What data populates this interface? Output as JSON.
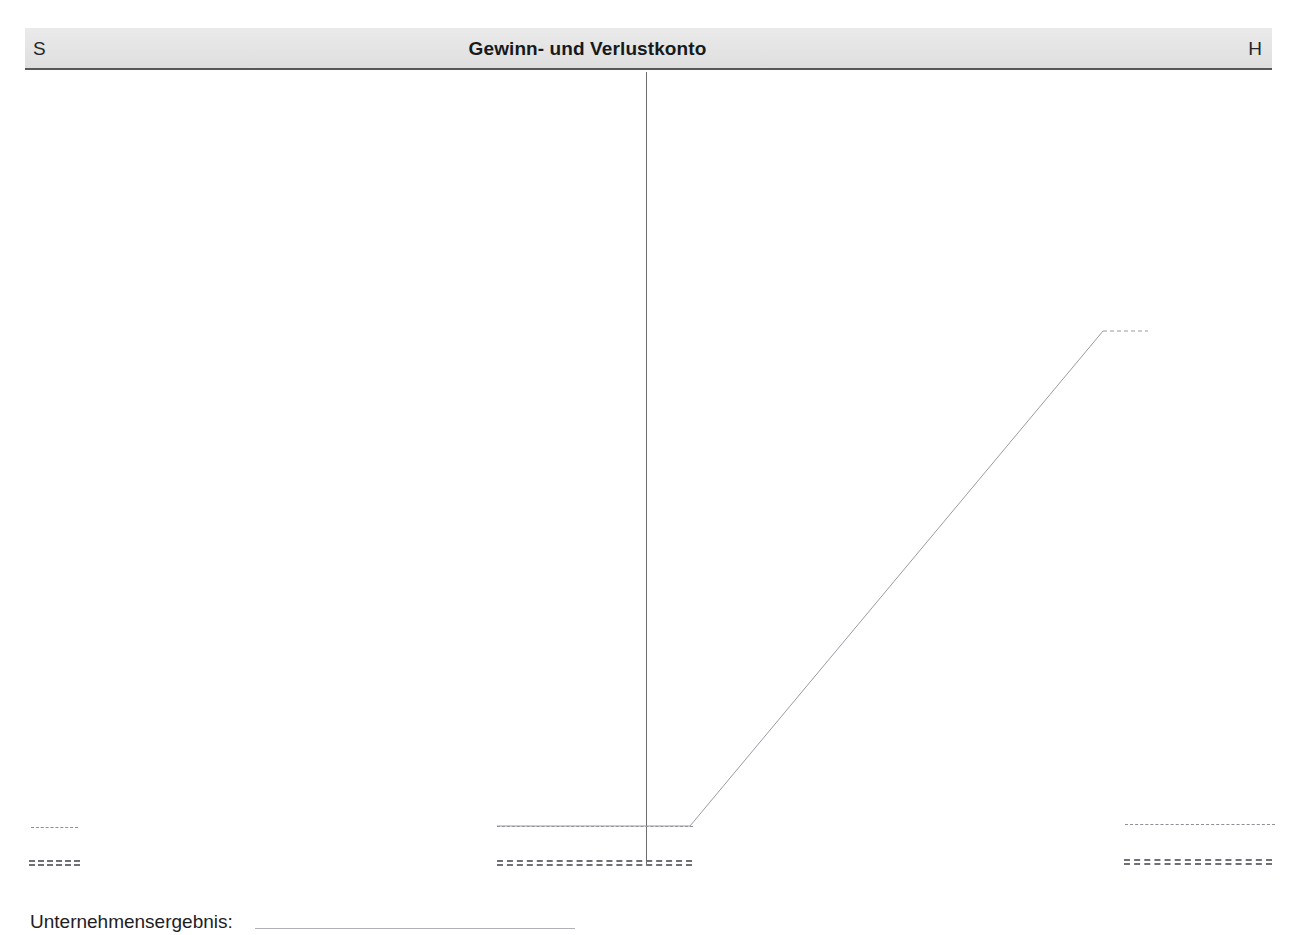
{
  "page": {
    "width": 1298,
    "height": 935,
    "background": "#ffffff",
    "document_type": "T-account worksheet (German accounting exercise)",
    "clipped_top_text": ""
  },
  "header": {
    "debit_label": "S",
    "credit_label": "H",
    "title": "Gewinn- und Verlustkonto",
    "band_color": "#e6e6e6",
    "band_border_color": "#585858"
  },
  "t_account": {
    "divider_color": "#6d6d6d",
    "debit_side": {
      "name": "Soll",
      "dashed_subtotal_rule": true,
      "double_closing_rule": true
    },
    "credit_side": {
      "name": "Haben",
      "dashed_subtotal_rule": true,
      "double_closing_rule": true
    }
  },
  "annotation": {
    "description": "Carry-forward polyline from the debit/credit balance line rising to the credit side",
    "line_color": "#9a9aa2"
  },
  "footer": {
    "label": "Unternehmensergebnis:",
    "fill_in_value": "",
    "fill_in_rule_color": "#b0b0b6"
  },
  "chart_data": {
    "type": "line",
    "title": "Gewinn- und Verlustkonto",
    "xlabel": "",
    "ylabel": "",
    "series": [
      {
        "name": "saldo-carry-forward",
        "points": [
          {
            "x": 497,
            "y": 826
          },
          {
            "x": 690,
            "y": 826
          },
          {
            "x": 1103,
            "y": 331
          },
          {
            "x": 1148,
            "y": 331
          }
        ]
      }
    ],
    "grid": false,
    "legend": "none"
  },
  "rules": {
    "debit_left_dashed": {
      "x": 31,
      "y": 827,
      "width": 47
    },
    "debit_left_double": {
      "x": 29,
      "y": 860,
      "width": 51
    },
    "debit_center_dashed": {
      "x": 497,
      "y": 826,
      "width": 196
    },
    "debit_center_double": {
      "x": 497,
      "y": 860,
      "width": 195
    },
    "credit_dashed": {
      "x": 1125,
      "y": 824,
      "width": 150
    },
    "credit_double": {
      "x": 1124,
      "y": 859,
      "width": 148
    },
    "footer_fill": {
      "x": 288,
      "y": 928,
      "width": 320
    }
  }
}
